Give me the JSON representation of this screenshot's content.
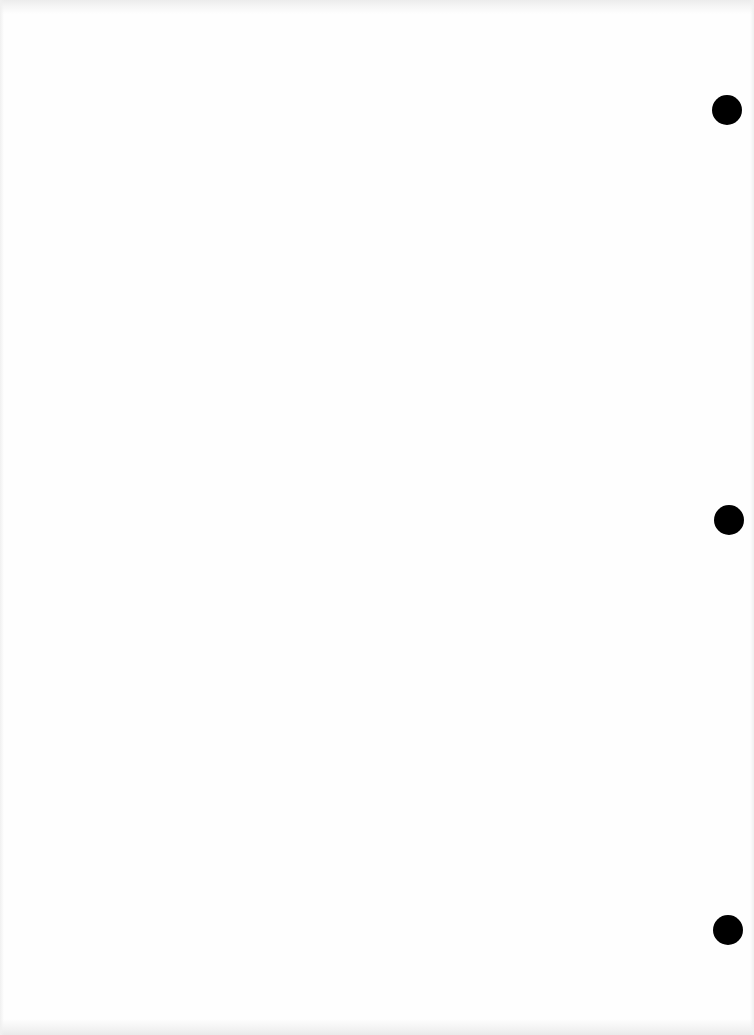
{
  "document": {
    "type": "blank-scanned-page",
    "background_color": "#fefefe",
    "text": "",
    "punch_holes": [
      {
        "cx": 727,
        "cy": 110,
        "r": 15,
        "color": "#000000"
      },
      {
        "cx": 729,
        "cy": 520,
        "r": 15,
        "color": "#000000"
      },
      {
        "cx": 728,
        "cy": 930,
        "r": 15,
        "color": "#000000"
      }
    ]
  }
}
